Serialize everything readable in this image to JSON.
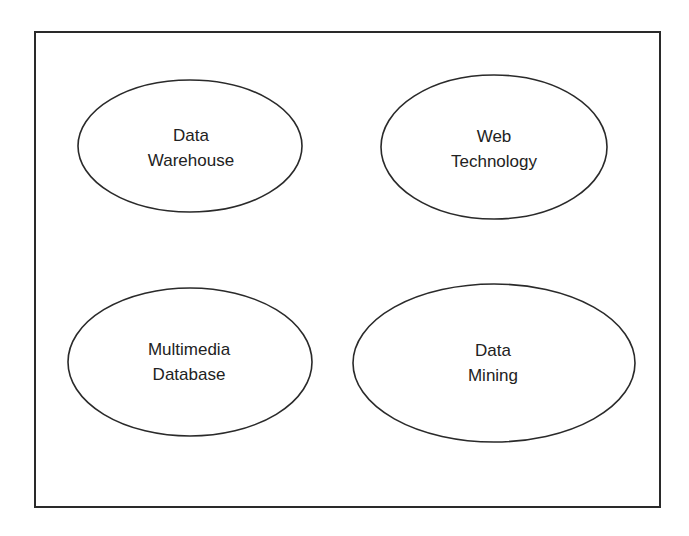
{
  "diagram": {
    "frame": {
      "stroke": "#2a2a2a"
    },
    "nodes": [
      {
        "id": "data-warehouse",
        "lines": [
          "Data",
          "Warehouse"
        ],
        "cx": 190,
        "cy": 146,
        "rx": 112,
        "ry": 66
      },
      {
        "id": "web-technology",
        "lines": [
          "Web",
          "Technology"
        ],
        "cx": 494,
        "cy": 147,
        "rx": 113,
        "ry": 72
      },
      {
        "id": "multimedia-database",
        "lines": [
          "Multimedia",
          "Database"
        ],
        "cx": 190,
        "cy": 362,
        "rx": 122,
        "ry": 74
      },
      {
        "id": "data-mining",
        "lines": [
          "Data",
          "Mining"
        ],
        "cx": 494,
        "cy": 363,
        "rx": 141,
        "ry": 79
      }
    ]
  }
}
